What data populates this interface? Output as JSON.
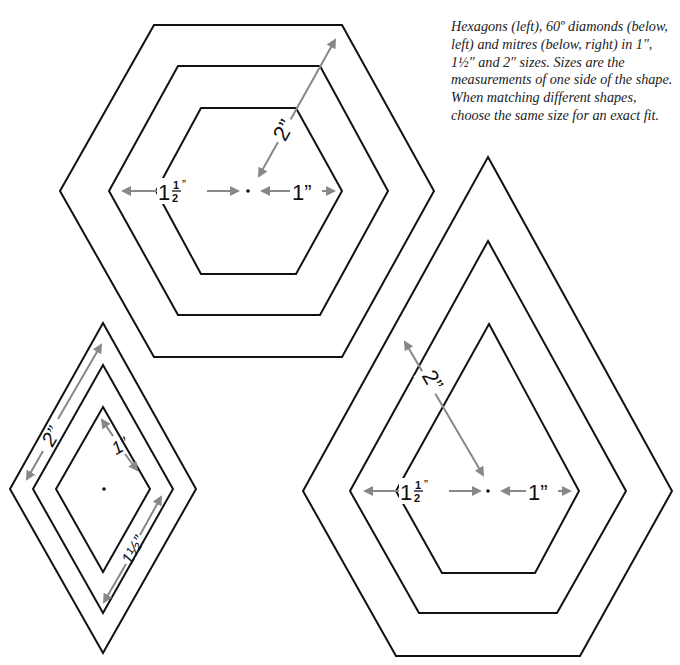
{
  "caption": "Hexagons (left), 60º diamonds (below, left) and mitres (below, right) in 1″, 1½″ and 2″ sizes. Sizes are the measurements of one side of the shape. When matching different shapes, choose the same size for an exact fit.",
  "colors": {
    "outline": "#111111",
    "arrow": "#888888",
    "background": "#ffffff"
  },
  "hexagon": {
    "label_2": "2”",
    "label_1_5_whole": "1",
    "label_1_5_num": "1",
    "label_1_5_den": "2",
    "label_1_5_quote": "”",
    "label_1": "1”"
  },
  "diamond": {
    "label_2": "2”",
    "label_1": "1”",
    "label_1_5": "1½”"
  },
  "mitre": {
    "label_2": "2”",
    "label_1_5_whole": "1",
    "label_1_5_num": "1",
    "label_1_5_den": "2",
    "label_1_5_quote": "”",
    "label_1": "1”"
  }
}
